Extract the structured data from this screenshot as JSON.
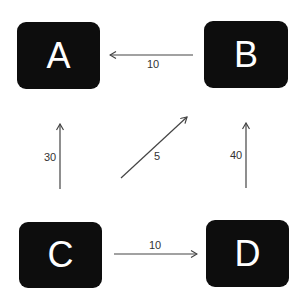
{
  "diagram": {
    "type": "directed-graph",
    "nodes": [
      {
        "id": "A",
        "label": "A"
      },
      {
        "id": "B",
        "label": "B"
      },
      {
        "id": "C",
        "label": "C"
      },
      {
        "id": "D",
        "label": "D"
      }
    ],
    "edges": [
      {
        "from": "B",
        "to": "A",
        "label": "10"
      },
      {
        "from": "C",
        "to": "A",
        "label": "30"
      },
      {
        "from": "C",
        "to": "B",
        "label": "5"
      },
      {
        "from": "D",
        "to": "B",
        "label": "40"
      },
      {
        "from": "C",
        "to": "D",
        "label": "10"
      }
    ],
    "colors": {
      "node_fill": "#0d0d0d",
      "node_text": "#ffffff",
      "edge": "#444444",
      "edge_label": "#333333"
    }
  }
}
